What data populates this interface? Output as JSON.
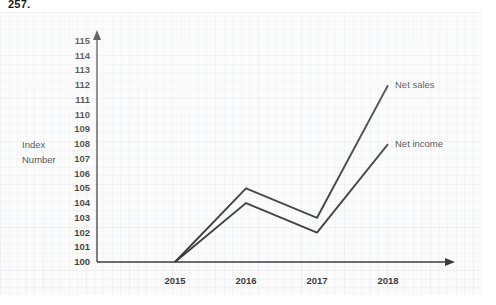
{
  "page_number": "257.",
  "chart_data": {
    "type": "line",
    "title": "",
    "subtitle": "",
    "xlabel": "",
    "ylabel": "Index Number",
    "ylabel_lines": [
      "Index",
      "Number"
    ],
    "categories": [
      "2015",
      "2016",
      "2017",
      "2018"
    ],
    "x": [
      2015,
      2016,
      2017,
      2018
    ],
    "series": [
      {
        "name": "Net sales",
        "values": [
          100,
          105,
          103,
          112
        ],
        "color": "#1a1a1a"
      },
      {
        "name": "Net income",
        "values": [
          100,
          104,
          102,
          108
        ],
        "color": "#1a1a1a"
      }
    ],
    "ylim": [
      100,
      115
    ],
    "ytick_labels": [
      "115",
      "114",
      "113",
      "112",
      "111",
      "110",
      "109",
      "108",
      "107",
      "106",
      "105",
      "104",
      "103",
      "102",
      "101",
      "100"
    ],
    "ytick_values": [
      115,
      114,
      113,
      112,
      111,
      110,
      109,
      108,
      107,
      106,
      105,
      104,
      103,
      102,
      101,
      100
    ],
    "grid": true,
    "grid_style": "graph-paper",
    "legend": "inline-right-of-line-end",
    "axis_arrows": true,
    "background_color": "#fafafa",
    "axis_color": "#1a1a1a"
  }
}
